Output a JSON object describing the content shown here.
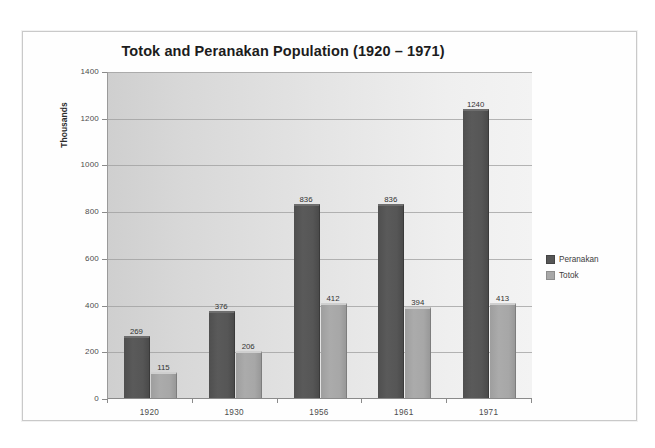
{
  "chart_data": {
    "type": "bar",
    "title": "Totok and Peranakan Population (1920 – 1971)",
    "xlabel": "",
    "ylabel": "Thousands",
    "categories": [
      "1920",
      "1930",
      "1956",
      "1961",
      "1971"
    ],
    "series": [
      {
        "name": "Peranakan",
        "color": "#565656",
        "values": [
          269,
          376,
          836,
          836,
          1240
        ]
      },
      {
        "name": "Totok",
        "color": "#a8a8a8",
        "values": [
          115,
          206,
          412,
          394,
          413
        ]
      }
    ],
    "ylim": [
      0,
      1400
    ],
    "yticks": [
      0,
      200,
      400,
      600,
      800,
      1000,
      1200,
      1400
    ],
    "ytick_labels": [
      "0",
      "200",
      "400",
      "600",
      "800",
      "1000",
      "1200",
      "1400"
    ],
    "grid": true,
    "data_labels": true,
    "legend_position": "right",
    "plot_background": "#e0e0e0"
  },
  "legend": {
    "items": [
      {
        "label": "Peranakan"
      },
      {
        "label": "Totok"
      }
    ]
  }
}
